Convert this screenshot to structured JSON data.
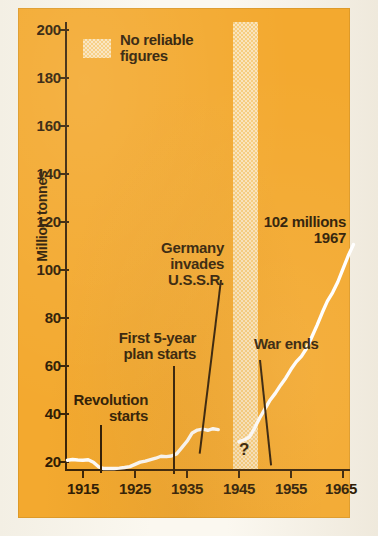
{
  "figure": {
    "background_color": "#f3a92f",
    "series_color": "#ffffff",
    "ink_color": "#2f1c05",
    "band_color": "#f7cf84"
  },
  "legend": {
    "swatch_name": "no-reliable-figures-swatch",
    "label": "No reliable\nfigures",
    "label_line1": "No reliable",
    "label_line2": "figures"
  },
  "annotations": {
    "revolution": {
      "line1": "Revolution",
      "line2": "starts",
      "year": 1917
    },
    "five_year_plan": {
      "line1": "First 5-year",
      "line2": "plan starts",
      "year": 1928
    },
    "germany_invades": {
      "line1": "Germany",
      "line2": "invades",
      "line3": "U.S.S.R.",
      "year": 1941
    },
    "war_ends": {
      "text": "War ends",
      "year": 1945
    },
    "peak": {
      "line1": "102 millions",
      "line2": "1967",
      "value": 102,
      "year": 1967
    },
    "question_mark": {
      "text": "?"
    }
  },
  "chart_data": {
    "type": "line",
    "title": "",
    "subtitle": "",
    "xlabel": "",
    "ylabel": "Million tonnes",
    "xlim": [
      1911,
      1968
    ],
    "ylim": [
      0,
      200
    ],
    "grid": false,
    "legend_position": "top-left-inside",
    "y_ticks": [
      20,
      40,
      60,
      80,
      100,
      120,
      140,
      160,
      180,
      200
    ],
    "y_tick_labels": [
      "20",
      "40",
      "60",
      "80",
      "100",
      "120",
      "140",
      "160",
      "180",
      "200"
    ],
    "x_ticks": [
      1915,
      1925,
      1935,
      1945,
      1955,
      1965
    ],
    "x_tick_labels": [
      "1915",
      "1925",
      "1935",
      "1945",
      "1955",
      "1965"
    ],
    "shaded_region": {
      "label": "No reliable figures",
      "x_start": 1941,
      "x_end": 1945,
      "y_start": 0,
      "y_end": 200
    },
    "series": [
      {
        "name": "Steel output",
        "units": "Million tonnes",
        "gap_years": [
          1941,
          1945
        ],
        "x": [
          1912,
          1913,
          1914,
          1915,
          1916,
          1917,
          1918,
          1919,
          1920,
          1921,
          1922,
          1923,
          1924,
          1925,
          1926,
          1927,
          1928,
          1929,
          1930,
          1931,
          1932,
          1933,
          1934,
          1935,
          1936,
          1937,
          1938,
          1939,
          1940,
          1941,
          1945,
          1946,
          1947,
          1948,
          1949,
          1950,
          1951,
          1952,
          1953,
          1954,
          1955,
          1956,
          1957,
          1958,
          1959,
          1960,
          1961,
          1962,
          1963,
          1964,
          1965,
          1966,
          1967
        ],
        "y": [
          4.0,
          4.3,
          4.1,
          4.0,
          4.2,
          3.1,
          1.0,
          0.2,
          0.2,
          0.2,
          0.4,
          0.7,
          1.1,
          2.1,
          3.1,
          3.6,
          4.3,
          4.9,
          5.8,
          5.6,
          5.9,
          6.9,
          9.7,
          12.6,
          16.4,
          17.7,
          18.1,
          17.6,
          18.3,
          17.9,
          12.3,
          13.3,
          14.5,
          18.6,
          23.3,
          27.3,
          31.4,
          34.5,
          38.1,
          41.4,
          45.3,
          48.7,
          51.2,
          54.9,
          60.0,
          65.3,
          71.0,
          76.3,
          80.2,
          85.0,
          91.0,
          96.9,
          102.0
        ]
      }
    ]
  }
}
